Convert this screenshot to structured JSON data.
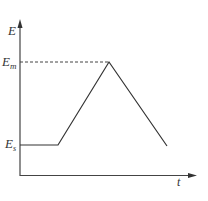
{
  "diagram": {
    "type": "line",
    "axes": {
      "y_label": "E",
      "x_label": "t"
    },
    "levels": {
      "max": {
        "label": "E",
        "sub": "m",
        "style": "dashed"
      },
      "start": {
        "label": "E",
        "sub": "s"
      }
    },
    "curve_points": [
      [
        20,
        145
      ],
      [
        58,
        145
      ],
      [
        109,
        62
      ],
      [
        167,
        146
      ]
    ],
    "colors": {
      "line": "#333333",
      "axis": "#444444"
    }
  }
}
